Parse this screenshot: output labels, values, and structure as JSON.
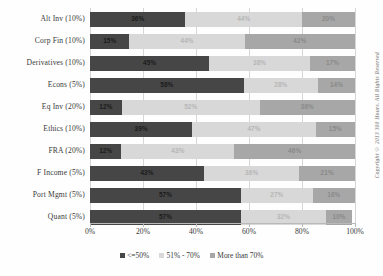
{
  "chart_data": {
    "type": "bar",
    "orientation": "horizontal",
    "stacked": true,
    "title": "",
    "xlabel": "",
    "ylabel": "",
    "xlim": [
      0,
      100
    ],
    "xticks": [
      "0%",
      "20%",
      "40%",
      "60%",
      "80%",
      "100%"
    ],
    "grid": true,
    "legend_position": "bottom",
    "categories": [
      "Alt Inv (10%)",
      "Corp Fin (10%)",
      "Derivatives (10%)",
      "Econs (5%)",
      "Eq Inv (20%)",
      "Ethics (10%)",
      "FRA (20%)",
      "F Income (5%)",
      "Port Mgmt (5%)",
      "Quant (5%)"
    ],
    "series": [
      {
        "name": "<=50%",
        "color": "#464646",
        "values": [
          36,
          15,
          45,
          58,
          12,
          39,
          12,
          43,
          57,
          57
        ],
        "labels": [
          "36%",
          "15%",
          "45%",
          "58%",
          "12%",
          "39%",
          "12%",
          "43%",
          "57%",
          "57%"
        ]
      },
      {
        "name": "51% - 70%",
        "color": "#d8d8d8",
        "values": [
          44,
          44,
          38,
          28,
          52,
          47,
          43,
          36,
          27,
          32
        ],
        "labels": [
          "44%",
          "44%",
          "38%",
          "28%",
          "52%",
          "47%",
          "43%",
          "36%",
          "27%",
          "32%"
        ]
      },
      {
        "name": "More than 70%",
        "color": "#a7a7a7",
        "values": [
          20,
          42,
          17,
          14,
          36,
          15,
          46,
          21,
          16,
          10
        ],
        "labels": [
          "20%",
          "42%",
          "17%",
          "14%",
          "36%",
          "15%",
          "46%",
          "21%",
          "16%",
          "10%"
        ]
      }
    ]
  },
  "legend": {
    "items": [
      {
        "label": "<=50%",
        "color": "#464646"
      },
      {
        "label": "51% - 70%",
        "color": "#d8d8d8"
      },
      {
        "label": "More than 70%",
        "color": "#a7a7a7"
      }
    ]
  },
  "copyright": {
    "text": "Copyright © 2013 300 Hours. All Rights Reserved"
  }
}
